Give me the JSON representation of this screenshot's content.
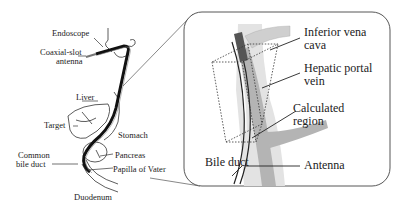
{
  "figure": {
    "left_panel": {
      "labels": {
        "endoscope": "Endoscope",
        "antenna_line1": "Coaxial-slot",
        "antenna_line2": "antenna",
        "liver": "Liver",
        "target": "Target",
        "stomach": "Stomach",
        "cbd_line1": "Common",
        "cbd_line2": "bile duct",
        "pancreas": "Pancreas",
        "papilla": "Papilla of Vater",
        "duodenum": "Duodenum"
      }
    },
    "inset_panel": {
      "labels": {
        "ivc_line1": "Inferior vena",
        "ivc_line2": "cava",
        "hpv_line1": "Hepatic portal",
        "hpv_line2": "vein",
        "region_line1": "Calculated",
        "region_line2": "region",
        "bile_duct": "Bile duct",
        "antenna": "Antenna"
      },
      "colors": {
        "ivc": "#e3e3e3",
        "portal_vein": "#b4b4b4",
        "antenna_tip": "#555555",
        "outline": "#444444"
      }
    }
  }
}
